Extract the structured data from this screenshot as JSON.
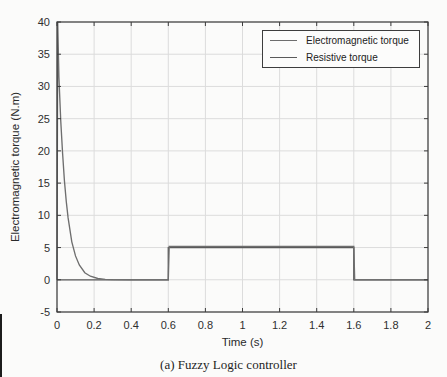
{
  "figure": {
    "caption": "(a) Fuzzy Logic controller"
  },
  "chart_data": {
    "type": "line",
    "title": "",
    "xlabel": "Time (s)",
    "ylabel": "Electromagnetic torque (N.m)",
    "xlim": [
      0,
      2
    ],
    "ylim": [
      -5,
      40
    ],
    "grid": true,
    "legend": {
      "position": "top-right",
      "border": true
    },
    "xticks": {
      "values": [
        0,
        0.2,
        0.4,
        0.6,
        0.8,
        1,
        1.2,
        1.4,
        1.6,
        1.8,
        2
      ],
      "labels": [
        "0",
        "0.2",
        "0.4",
        "0.6",
        "0.8",
        "1",
        "1.2",
        "1.4",
        "1.6",
        "1.8",
        "2"
      ]
    },
    "yticks": {
      "values": [
        -5,
        0,
        5,
        10,
        15,
        20,
        25,
        30,
        35,
        40
      ],
      "labels": [
        "-5",
        "0",
        "5",
        "10",
        "15",
        "20",
        "25",
        "30",
        "35",
        "40"
      ]
    },
    "series": [
      {
        "name": "Electromagnetic torque",
        "color": "#6e6e6e",
        "points": [
          [
            0,
            0
          ],
          [
            0.004,
            40
          ],
          [
            0.01,
            31.5
          ],
          [
            0.02,
            24.8
          ],
          [
            0.03,
            19.6
          ],
          [
            0.04,
            15.4
          ],
          [
            0.05,
            12.1
          ],
          [
            0.06,
            9.6
          ],
          [
            0.08,
            5.9
          ],
          [
            0.1,
            3.7
          ],
          [
            0.12,
            2.3
          ],
          [
            0.15,
            1.1
          ],
          [
            0.18,
            0.55
          ],
          [
            0.22,
            0.2
          ],
          [
            0.26,
            0.08
          ],
          [
            0.3,
            0.03
          ],
          [
            0.4,
            0
          ],
          [
            0.6,
            0
          ],
          [
            0.605,
            5.2
          ],
          [
            1.0,
            5.2
          ],
          [
            1.6,
            5.2
          ],
          [
            1.605,
            0
          ],
          [
            2,
            0
          ]
        ]
      },
      {
        "name": "Resistive torque",
        "color": "#5a5a5a",
        "points": [
          [
            0,
            0
          ],
          [
            0.6,
            0
          ],
          [
            0.6,
            5
          ],
          [
            1.6,
            5
          ],
          [
            1.6,
            0
          ],
          [
            2,
            0
          ]
        ]
      }
    ],
    "colors": {
      "axis": "#3d3d3d",
      "grid": "#dcdcdc",
      "background": "#fbfbfa",
      "text": "#2f2f2f"
    }
  }
}
